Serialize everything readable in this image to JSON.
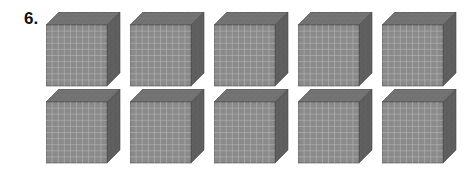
{
  "problem": {
    "number": "6.",
    "item": "base-ten thousand cube",
    "rows": 2,
    "per_row": 5,
    "total_cubes": 10,
    "grid_divisions": 10
  },
  "colors": {
    "front": "#8a8a8a",
    "top": "#6e6e6e",
    "side": "#5a5a5a",
    "grid_line": "#b5b5b5",
    "edge": "#4a4a4a"
  },
  "layout": {
    "x_positions": [
      46,
      130,
      214,
      298,
      382
    ],
    "y_positions": [
      12,
      89
    ]
  }
}
